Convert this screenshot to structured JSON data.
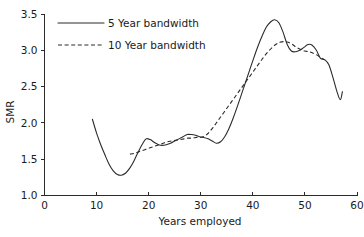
{
  "chart_data": {
    "type": "line",
    "title": "",
    "xlabel": "Years employed",
    "ylabel": "SMR",
    "xlim": [
      0,
      60
    ],
    "ylim": [
      1.0,
      3.5
    ],
    "xticks": [
      "0",
      "10",
      "20",
      "30",
      "40",
      "50",
      "60"
    ],
    "yticks": [
      "1.0",
      "1.5",
      "2.0",
      "2.5",
      "3.0",
      "3.5"
    ],
    "xtick_values": [
      0,
      10,
      20,
      30,
      40,
      50,
      60
    ],
    "ytick_values": [
      1.0,
      1.5,
      2.0,
      2.5,
      3.0,
      3.5
    ],
    "grid": false,
    "legend_position": "upper-left",
    "line_color": "#2b2b2b",
    "background_color": "#ffffff",
    "series": [
      {
        "name": "5 Year bandwidth",
        "style": "solid",
        "x": [
          9.2,
          10.0,
          10.8,
          11.6,
          12.4,
          13.2,
          14.0,
          14.8,
          15.6,
          16.4,
          17.2,
          18.0,
          18.8,
          19.5,
          20.3,
          21.1,
          21.9,
          22.6,
          23.4,
          24.2,
          25.0,
          25.8,
          26.6,
          27.4,
          28.2,
          29.0,
          29.8,
          30.6,
          31.4,
          32.2,
          33.0,
          33.8,
          34.6,
          35.4,
          36.2,
          37.0,
          37.8,
          38.6,
          39.4,
          40.2,
          41.0,
          41.8,
          42.6,
          43.4,
          44.2,
          45.0,
          45.8,
          46.6,
          47.4,
          48.2,
          49.0,
          49.8,
          50.6,
          51.4,
          52.2,
          53.0,
          53.8,
          54.6,
          55.4,
          56.2,
          56.8,
          57.2
        ],
        "y": [
          2.05,
          1.86,
          1.7,
          1.56,
          1.43,
          1.34,
          1.29,
          1.28,
          1.31,
          1.38,
          1.48,
          1.6,
          1.71,
          1.78,
          1.77,
          1.73,
          1.7,
          1.69,
          1.7,
          1.72,
          1.75,
          1.78,
          1.81,
          1.84,
          1.84,
          1.83,
          1.81,
          1.8,
          1.78,
          1.75,
          1.72,
          1.74,
          1.81,
          1.92,
          2.06,
          2.22,
          2.39,
          2.56,
          2.73,
          2.9,
          3.06,
          3.2,
          3.32,
          3.39,
          3.42,
          3.38,
          3.25,
          3.08,
          2.99,
          2.98,
          3.0,
          3.04,
          3.08,
          3.07,
          3.0,
          2.89,
          2.87,
          2.8,
          2.62,
          2.42,
          2.32,
          2.43
        ]
      },
      {
        "name": "10 Year bandwidth",
        "style": "dashed",
        "x": [
          16.4,
          17.2,
          18.0,
          18.8,
          19.6,
          20.4,
          21.2,
          22.0,
          22.8,
          23.6,
          24.4,
          25.2,
          26.0,
          26.8,
          27.6,
          28.4,
          29.2,
          30.0,
          30.8,
          31.6,
          32.4,
          33.2,
          34.0,
          34.8,
          35.6,
          36.4,
          37.2,
          38.0,
          38.8,
          39.6,
          40.4,
          41.2,
          42.0,
          42.8,
          43.6,
          44.4,
          45.2,
          46.0,
          46.8,
          47.6,
          48.4,
          49.2,
          50.0,
          50.8,
          51.6,
          52.4,
          53.2,
          53.8
        ],
        "y": [
          1.57,
          1.58,
          1.6,
          1.62,
          1.64,
          1.66,
          1.68,
          1.7,
          1.72,
          1.74,
          1.75,
          1.76,
          1.77,
          1.78,
          1.79,
          1.79,
          1.8,
          1.8,
          1.82,
          1.87,
          1.94,
          2.02,
          2.1,
          2.18,
          2.26,
          2.34,
          2.42,
          2.5,
          2.58,
          2.66,
          2.74,
          2.82,
          2.9,
          2.97,
          3.03,
          3.08,
          3.11,
          3.12,
          3.11,
          3.08,
          3.04,
          3.01,
          2.99,
          2.98,
          2.96,
          2.93,
          2.89,
          2.87
        ]
      }
    ]
  },
  "legend": {
    "entries": [
      {
        "label": "5 Year bandwidth",
        "style": "solid"
      },
      {
        "label": "10 Year bandwidth",
        "style": "dashed"
      }
    ]
  },
  "axes": {
    "x_title": "Years employed",
    "y_title": "SMR"
  }
}
